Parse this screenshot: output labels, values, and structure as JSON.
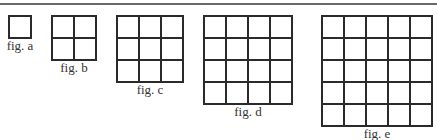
{
  "figures": [
    {
      "label": "fig. a",
      "n": 1,
      "x": 8,
      "y": 15,
      "cell": 22,
      "label_y": 37
    },
    {
      "label": "fig. b",
      "n": 2,
      "x": 51,
      "y": 15,
      "cell": 22,
      "label_y": 59
    },
    {
      "label": "fig. c",
      "n": 3,
      "x": 116,
      "y": 15,
      "cell": 22,
      "label_y": 81
    },
    {
      "label": "fig. d",
      "n": 4,
      "x": 203,
      "y": 15,
      "cell": 22,
      "label_y": 103
    },
    {
      "label": "fig. e",
      "n": 5,
      "x": 321,
      "y": 15,
      "cell": 22,
      "label_y": 125
    }
  ],
  "colors": {
    "line": "#2a2a2a",
    "rule": "#6a6a6a"
  }
}
